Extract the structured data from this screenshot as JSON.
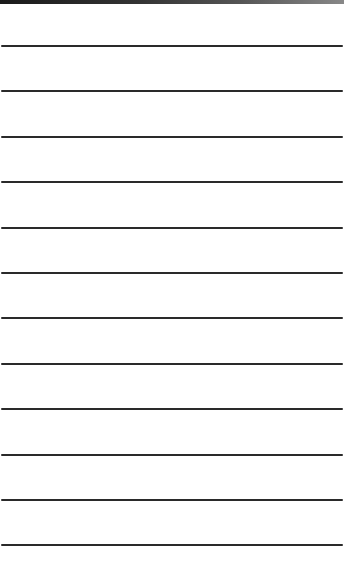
{
  "paper": {
    "background": "#ffffff",
    "line_color": "#2a2a2a",
    "top_strip_color": "#1a1a1a",
    "line_positions": [
      46,
      91,
      137,
      182,
      228,
      273,
      318,
      364,
      409,
      455,
      500,
      545
    ]
  }
}
